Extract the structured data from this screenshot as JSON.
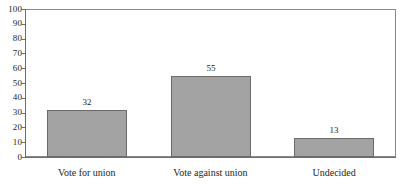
{
  "chart_data": {
    "type": "bar",
    "title": "",
    "xlabel": "",
    "ylabel": "",
    "categories": [
      "Vote for union",
      "Vote against union",
      "Undecided"
    ],
    "values": [
      32,
      55,
      13
    ],
    "value_labels": [
      "32",
      "55",
      "13"
    ],
    "ylim": [
      0,
      100
    ],
    "y_ticks": [
      0,
      10,
      20,
      30,
      40,
      50,
      60,
      70,
      80,
      90,
      100
    ],
    "y_tick_labels": [
      "0",
      "10",
      "20",
      "30",
      "40",
      "50",
      "60",
      "70",
      "80",
      "90",
      "100"
    ],
    "grid": false,
    "legend": false,
    "legend_position": "none",
    "orientation": "vertical",
    "bar_fill_color": "#a3a3a3",
    "bar_border_color": "#6a6a6a",
    "axis_color": "#6d6d6d",
    "frame_color": "#8a8a8a",
    "text_color": "#231f20",
    "background_color": "#ffffff"
  }
}
